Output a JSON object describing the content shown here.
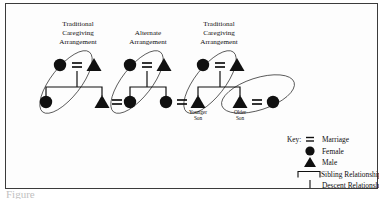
{
  "figure": {
    "caption": "Figure",
    "background_color": "#ffffff",
    "frame_color": "#3b3b3b",
    "ink_color": "#101010"
  },
  "groups": [
    {
      "id": "group-1",
      "label_lines": [
        "Traditional",
        "Caregiving",
        "Arrangement"
      ],
      "label_x": 72,
      "label_y": 22,
      "ellipse": {
        "cx": 60,
        "cy": 78,
        "rx": 38,
        "ry": 15,
        "rotate": -52
      }
    },
    {
      "id": "group-2",
      "label_lines": [
        "Alternate",
        "Arrangement"
      ],
      "label_x": 142,
      "label_y": 30,
      "ellipse": {
        "cx": 131,
        "cy": 78,
        "rx": 38,
        "ry": 15,
        "rotate": -52
      }
    },
    {
      "id": "group-3",
      "label_lines": [
        "Traditional",
        "Caregiving",
        "Arrangement"
      ],
      "label_x": 212,
      "label_y": 22,
      "ellipse": {
        "cx": 204,
        "cy": 78,
        "rx": 38,
        "ry": 15,
        "rotate": -52
      }
    },
    {
      "id": "group-4",
      "label_lines": [],
      "label_x": 0,
      "label_y": 0,
      "ellipse": {
        "cx": 257,
        "cy": 89,
        "rx": 36,
        "ry": 16,
        "rotate": -20
      }
    }
  ],
  "families": [
    {
      "id": "family-1",
      "parents": {
        "female_x": 54,
        "male_x": 88,
        "y": 61,
        "marriage_x": 71
      },
      "descent": {
        "x": 71,
        "y_top": 68,
        "y_bottom": 83
      },
      "sibling_bracket": {
        "x_left": 40,
        "x_right": 96,
        "y": 83
      },
      "children": [
        {
          "type": "female",
          "x": 40,
          "y": 98,
          "label_lines": []
        },
        {
          "type": "male",
          "x": 96,
          "y": 98,
          "label_lines": []
        }
      ]
    },
    {
      "id": "family-2",
      "parents": {
        "female_x": 124,
        "male_x": 158,
        "y": 61,
        "marriage_x": 141
      },
      "descent": {
        "x": 141,
        "y_top": 68,
        "y_bottom": 83
      },
      "sibling_bracket": {
        "x_left": 124,
        "x_right": 160,
        "y": 83
      },
      "children": [
        {
          "type": "female",
          "x": 124,
          "y": 98,
          "label_lines": []
        },
        {
          "type": "female",
          "x": 160,
          "y": 98,
          "label_lines": []
        }
      ]
    },
    {
      "id": "family-3",
      "parents": {
        "female_x": 197,
        "male_x": 231,
        "y": 61,
        "marriage_x": 214
      },
      "descent": {
        "x": 214,
        "y_top": 68,
        "y_bottom": 83
      },
      "sibling_bracket": {
        "x_left": 192,
        "x_right": 234,
        "y": 83
      },
      "children": [
        {
          "type": "male",
          "x": 192,
          "y": 99,
          "label_lines": [
            "Younger",
            "Son"
          ]
        },
        {
          "type": "male",
          "x": 234,
          "y": 99,
          "label_lines": [
            "Older",
            "Son"
          ]
        }
      ]
    }
  ],
  "bottom_marriages": [
    {
      "id": "marriage-1-2",
      "x": 110,
      "y": 98
    },
    {
      "id": "marriage-2-3",
      "x": 176,
      "y": 98
    },
    {
      "id": "marriage-3-4",
      "x": 250,
      "y": 98
    }
  ],
  "bottom_spouses": [
    {
      "id": "spouse-a",
      "type": "female",
      "x": 124,
      "y": 98
    },
    {
      "id": "spouse-b",
      "type": "female",
      "x": 267,
      "y": 98
    }
  ],
  "key": {
    "title": "Key:",
    "title_x": 283,
    "title_y": 135,
    "symbol_x": 303,
    "label_x": 315,
    "entries": [
      {
        "symbol": "marriage-icon",
        "label": "Marriage",
        "y": 135
      },
      {
        "symbol": "female-icon",
        "label": "Female",
        "y": 146
      },
      {
        "symbol": "male-icon",
        "label": "Male",
        "y": 157
      },
      {
        "symbol": "sibling-bracket-icon",
        "label": "Sibling Relationship",
        "y": 168
      },
      {
        "symbol": "descent-line-icon",
        "label": "Descent Relationship",
        "y": 179
      }
    ]
  }
}
